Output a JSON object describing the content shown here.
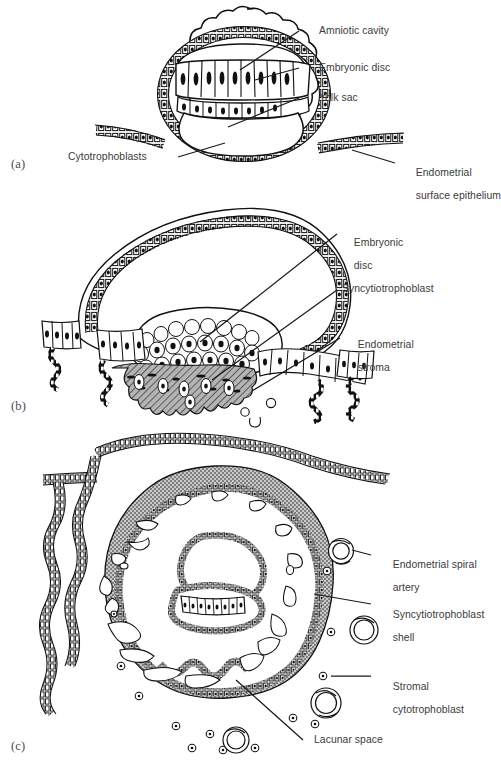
{
  "figure": {
    "title_ghost": "",
    "domain_note": "Three-stage line drawing of human blastocyst implantation into endometrium",
    "panels": [
      {
        "letter": "(a)",
        "caption_id": "panel-a",
        "description": "Blastocyst at early implantation: amniotic cavity, embryonic disc, yolk sac, surrounded by cytotrophoblasts, lying against endometrial surface epithelium",
        "labels": [
          {
            "name": "amniotic-cavity",
            "text": "Amniotic cavity"
          },
          {
            "name": "embryonic-disc",
            "text": "Embryonic disc"
          },
          {
            "name": "yolk-sac",
            "text": "Yolk sac"
          },
          {
            "name": "cytotrophoblasts",
            "text": "Cytotrophoblasts"
          },
          {
            "name": "endometrial-surface-epithelium",
            "text_line1": "Endometrial",
            "text_line2": "surface epithelium"
          }
        ]
      },
      {
        "letter": "(b)",
        "caption_id": "panel-b",
        "description": "Blastocyst eroding the endometrial surface epithelium; syncytiotrophoblast invades endometrial stroma",
        "labels": [
          {
            "name": "embryonic-disc",
            "text_line1": "Embryonic",
            "text_line2": "disc"
          },
          {
            "name": "syncytiotrophoblast",
            "text": "Syncytiotrophoblast"
          },
          {
            "name": "endometrial-stroma",
            "text_line1": "Endometrial",
            "text_line2": "stroma"
          }
        ]
      },
      {
        "letter": "(c)",
        "caption_id": "panel-c",
        "description": "Fully implanted conceptus enclosed in syncytiotrophoblast shell containing lacunar spaces; stromal cytotrophoblasts and endometrial spiral arteries in surrounding stroma",
        "labels": [
          {
            "name": "endometrial-spiral-artery",
            "text_line1": "Endometrial spiral",
            "text_line2": "artery"
          },
          {
            "name": "syncytiotrophoblast-shell",
            "text_line1": "Syncytiotrophoblast",
            "text_line2": "shell"
          },
          {
            "name": "stromal-cytotrophoblast",
            "text_line1": "Stromal",
            "text_line2": "cytotrophoblast"
          },
          {
            "name": "lacunar-space",
            "text": "Lacunar space"
          }
        ]
      }
    ],
    "colors": {
      "ink": "#111111",
      "label_text": "#3b3b3b",
      "panel_letter": "#4b4b4b",
      "shell_gray": "#a8a8a8",
      "stroma_gray": "#9b9b9b",
      "page": "#ffffff"
    }
  }
}
